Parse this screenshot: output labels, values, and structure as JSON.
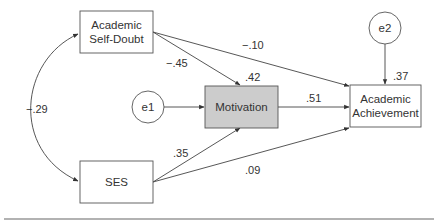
{
  "diagram": {
    "type": "path-model",
    "nodes": {
      "self_doubt": {
        "line1": "Academic",
        "line2": "Self-Doubt"
      },
      "ses": {
        "label": "SES"
      },
      "motivation": {
        "label": "Motivation",
        "fill": "#cccccc"
      },
      "achievement": {
        "line1": "Academic",
        "line2": "Achievement"
      },
      "e1": {
        "label": "e1"
      },
      "e2": {
        "label": "e2"
      }
    },
    "coefficients": {
      "self_doubt_ses_covariance": "−.29",
      "self_doubt_to_motivation": "−.45",
      "self_doubt_to_achievement": "−.10",
      "motivation_r2": ".42",
      "motivation_to_achievement": ".51",
      "achievement_r2": ".37",
      "ses_to_motivation": ".35",
      "ses_to_achievement": ".09"
    },
    "colors": {
      "line": "#444444",
      "box_border": "#555555",
      "motivation_fill": "#cccccc",
      "rule": "#999999"
    }
  }
}
